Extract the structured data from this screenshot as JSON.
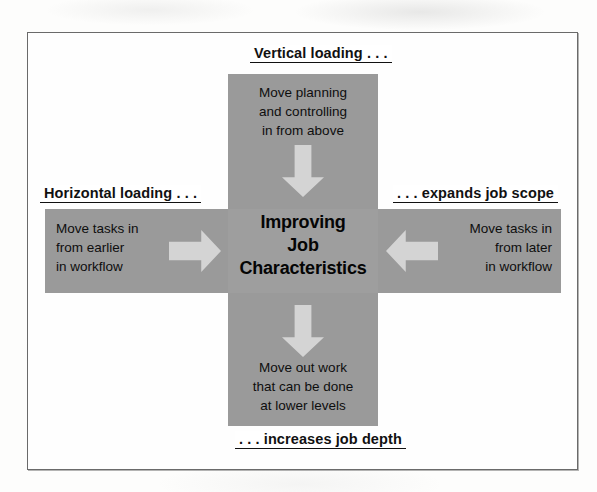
{
  "figure": {
    "center_title": "Improving\nJob\nCharacteristics",
    "labels": {
      "top": "Vertical loading . . .",
      "left": "Horizontal loading . . .",
      "right": ". . . expands job scope",
      "bottom": ". . . increases job depth"
    },
    "arms": {
      "top": "Move planning\nand controlling\nin from above",
      "left": "Move tasks in\nfrom earlier\nin workflow",
      "right": "Move tasks in\nfrom later\nin workflow",
      "bottom": "Move out work\nthat can be done\nat lower levels"
    },
    "icons": {
      "arrow_top": "arrow-down-icon",
      "arrow_bottom": "arrow-down-icon",
      "arrow_left": "arrow-right-icon",
      "arrow_right": "arrow-left-icon"
    },
    "colors": {
      "band": "#9a9a9a",
      "hub": "#9e9e9e",
      "arrow": "#d4d4d4",
      "frame_border": "#6a6a6a",
      "text": "#111111",
      "page": "#fdfdfc"
    }
  }
}
